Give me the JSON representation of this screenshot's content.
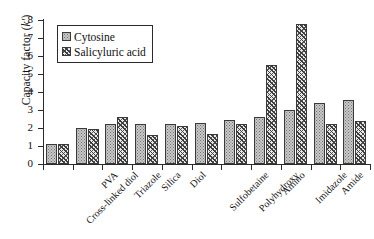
{
  "chart_data": {
    "type": "bar",
    "title": "",
    "xlabel": "",
    "ylabel": "Capacity factor (k')",
    "ylim": [
      0,
      8
    ],
    "yticks": [
      0,
      1,
      2,
      3,
      4,
      5,
      6,
      7,
      8
    ],
    "grid": false,
    "legend_position": "top-left",
    "categories": [
      "Cross-linked diol",
      "PVA",
      "Triazole",
      "Silica",
      "Diol",
      "Sulfobetaine",
      "Polyhydroxy",
      "Amino",
      "Imidazole",
      "Amide",
      "Aspartamide"
    ],
    "series": [
      {
        "name": "Cytosine",
        "pattern": "light-dotted",
        "color": "#c9c9c9",
        "values": [
          1.1,
          2.0,
          2.2,
          2.2,
          2.2,
          2.3,
          2.45,
          2.6,
          3.0,
          3.4,
          3.55
        ]
      },
      {
        "name": "Salicyluric acid",
        "pattern": "dark-crosshatch",
        "color": "#3c3c3c",
        "values": [
          1.1,
          1.95,
          2.6,
          1.6,
          2.1,
          1.65,
          2.2,
          5.5,
          7.8,
          2.2,
          2.4
        ]
      }
    ]
  },
  "axis": {
    "y_title_main": "Capacity factor (",
    "y_title_italic": "k'",
    "y_title_close": ")"
  },
  "legend": {
    "items": [
      {
        "label": "Cytosine"
      },
      {
        "label": "Salicyluric acid"
      }
    ]
  }
}
